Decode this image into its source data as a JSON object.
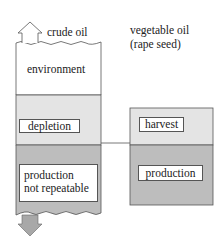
{
  "left_column": {
    "title": "crude oil",
    "sections": {
      "environment": "environment",
      "depletion": "depletion",
      "production_line1": "production",
      "production_line2": "not repeatable"
    }
  },
  "right_column": {
    "title_line1": "vegetable oil",
    "title_line2": "(rape seed)",
    "sections": {
      "harvest": "harvest",
      "production": "production"
    }
  },
  "colors": {
    "light_gray": "#e4e4e4",
    "dark_gray": "#bdbdbd",
    "outline": "#555555"
  }
}
